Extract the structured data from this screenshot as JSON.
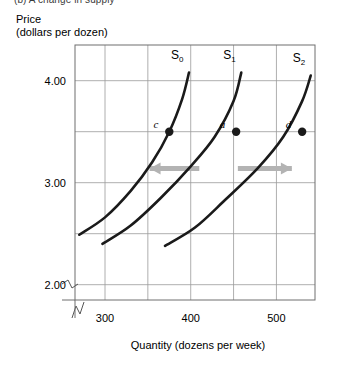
{
  "figure": {
    "panel_caption": "(b) A change in supply",
    "y_axis_title_line1": "Price",
    "y_axis_title_line2": "(dollars per dozen)",
    "x_axis_title": "Quantity (dozens per week)"
  },
  "colors": {
    "curve": "#1a1a1a",
    "grid": "#9b9b9b",
    "frame": "#6e6e6e",
    "arrow": "#b3b3b3",
    "text": "#000000",
    "background": "#ffffff"
  },
  "chart_data": {
    "type": "line",
    "title": "(b) A change in supply",
    "xlabel": "Quantity (dozens per week)",
    "ylabel": "Price (dollars per dozen)",
    "grid": true,
    "legend": "none",
    "xlim": [
      265,
      545
    ],
    "ylim": [
      1.85,
      4.35
    ],
    "x_ticks": [
      300,
      400,
      500
    ],
    "x_tick_labels": [
      "300",
      "400",
      "500"
    ],
    "x_gridlines": [
      300,
      350,
      400,
      450,
      500
    ],
    "y_ticks": [
      2.0,
      3.0,
      4.0
    ],
    "y_tick_labels": [
      "2.00",
      "3.00",
      "4.00"
    ],
    "y_gridlines": [
      2.0,
      2.5,
      3.0,
      3.5,
      4.0
    ],
    "axis_break_x": true,
    "axis_break_y": true,
    "series": [
      {
        "name": "S0",
        "label": "S",
        "subscript": "0",
        "points": [
          [
            270,
            2.49
          ],
          [
            300,
            2.66
          ],
          [
            330,
            2.92
          ],
          [
            355,
            3.2
          ],
          [
            375,
            3.5
          ],
          [
            390,
            3.82
          ],
          [
            398,
            4.08
          ]
        ]
      },
      {
        "name": "S1",
        "label": "S",
        "subscript": "1",
        "points": [
          [
            297,
            2.4
          ],
          [
            330,
            2.58
          ],
          [
            365,
            2.85
          ],
          [
            400,
            3.16
          ],
          [
            428,
            3.45
          ],
          [
            450,
            3.8
          ],
          [
            459,
            4.08
          ]
        ]
      },
      {
        "name": "S2",
        "label": "S",
        "subscript": "2",
        "points": [
          [
            370,
            2.38
          ],
          [
            405,
            2.56
          ],
          [
            440,
            2.83
          ],
          [
            478,
            3.14
          ],
          [
            508,
            3.45
          ],
          [
            530,
            3.8
          ],
          [
            540,
            4.05
          ]
        ]
      }
    ],
    "points": [
      {
        "label": "c",
        "x": 375,
        "y": 3.5,
        "on_series": "S0"
      },
      {
        "label": "a",
        "x": 453,
        "y": 3.5,
        "on_series": "S1"
      },
      {
        "label": "d",
        "x": 530,
        "y": 3.5,
        "on_series": "S2"
      }
    ],
    "annotations": [
      {
        "name": "decrease-in-supply-arrow",
        "direction": "left",
        "y": 3.14,
        "x_from": 410,
        "x_to": 352
      },
      {
        "name": "increase-in-supply-arrow",
        "direction": "right",
        "y": 3.14,
        "x_from": 455,
        "x_to": 518
      }
    ]
  }
}
